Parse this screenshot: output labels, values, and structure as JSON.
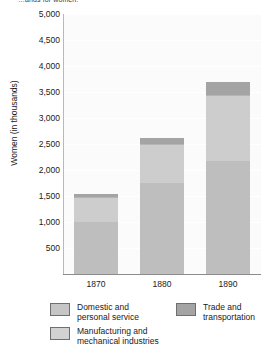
{
  "clipped_caption": "…ands for women.",
  "chart_data": {
    "type": "bar",
    "stacked": true,
    "title": "",
    "xlabel": "",
    "ylabel": "Women (in thousands)",
    "categories": [
      "1870",
      "1880",
      "1890"
    ],
    "ylim": [
      0,
      5000
    ],
    "yticks": [
      "500",
      "1,000",
      "1,500",
      "2,000",
      "2,500",
      "3,000",
      "3,500",
      "4,000",
      "4,500",
      "5,000"
    ],
    "ytick_values": [
      500,
      1000,
      1500,
      2000,
      2500,
      3000,
      3500,
      4000,
      4500,
      5000
    ],
    "grid": true,
    "legend_position": "bottom",
    "series": [
      {
        "name": "Domestic and\npersonal service",
        "key": "domestic",
        "color": "#bebebe",
        "values": [
          1000,
          1750,
          2170
        ]
      },
      {
        "name": "Manufacturing and\nmechanical industries",
        "key": "manufacturing",
        "color": "#cdcdcd",
        "values": [
          490,
          750,
          1280
        ]
      },
      {
        "name": "Trade and\ntransportation",
        "key": "trade",
        "color": "#a4a4a4",
        "values": [
          50,
          120,
          250
        ]
      }
    ],
    "totals": [
      1540,
      2620,
      3700
    ]
  },
  "legend": {
    "items": [
      {
        "label": "Domestic and\npersonal service",
        "key": "domestic"
      },
      {
        "label": "Trade and\ntransportation",
        "key": "trade"
      },
      {
        "label": "Manufacturing and\nmechanical industries",
        "key": "manufacturing"
      }
    ]
  }
}
